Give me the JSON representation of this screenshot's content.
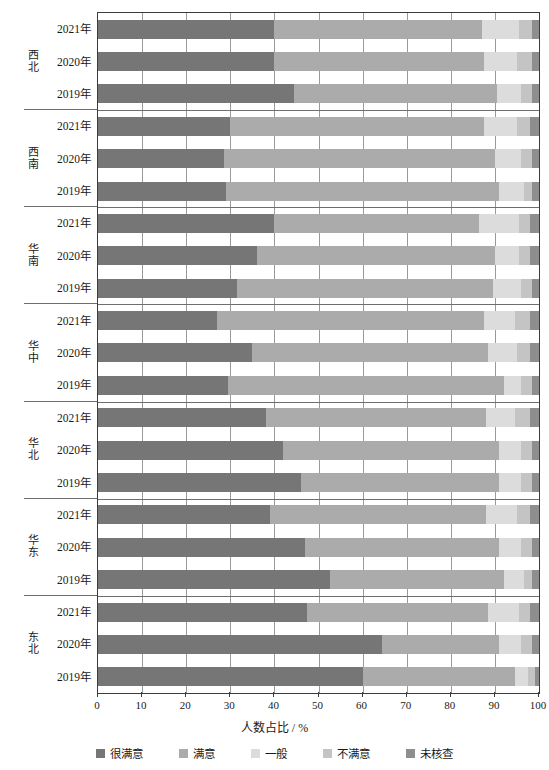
{
  "chart_data": {
    "type": "bar",
    "orientation": "horizontal",
    "stacked": true,
    "normalized_percent": true,
    "title": "",
    "xlabel": "人数占比 / %",
    "ylabel": "",
    "xlim": [
      0,
      100
    ],
    "xticks": [
      0,
      10,
      20,
      30,
      40,
      50,
      60,
      70,
      80,
      90,
      100
    ],
    "grid": "vertical",
    "legend_position": "bottom",
    "legend": [
      "很满意",
      "满意",
      "一般",
      "不满意",
      "未核查"
    ],
    "colors": [
      "#767676",
      "#ababab",
      "#dcdcdc",
      "#c4c4c4",
      "#8e8e8e"
    ],
    "series": [
      {
        "name": "很满意",
        "color": "#767676"
      },
      {
        "name": "满意",
        "color": "#ababab"
      },
      {
        "name": "一般",
        "color": "#dcdcdc"
      },
      {
        "name": "不满意",
        "color": "#c4c4c4"
      },
      {
        "name": "未核查",
        "color": "#8e8e8e"
      }
    ],
    "groups": [
      {
        "region": "西北",
        "rows": [
          {
            "category": "2021年",
            "values": [
              40.0,
              47.0,
              8.5,
              3.0,
              1.5
            ]
          },
          {
            "category": "2020年",
            "values": [
              40.0,
              47.5,
              7.5,
              3.5,
              1.5
            ]
          },
          {
            "category": "2019年",
            "values": [
              44.5,
              46.0,
              5.5,
              2.5,
              1.5
            ]
          }
        ]
      },
      {
        "region": "西南",
        "rows": [
          {
            "category": "2021年",
            "values": [
              30.0,
              57.5,
              7.5,
              3.0,
              2.0
            ]
          },
          {
            "category": "2020年",
            "values": [
              28.5,
              61.5,
              6.0,
              2.5,
              1.5
            ]
          },
          {
            "category": "2019年",
            "values": [
              29.0,
              62.0,
              5.5,
              2.0,
              1.5
            ]
          }
        ]
      },
      {
        "region": "华南",
        "rows": [
          {
            "category": "2021年",
            "values": [
              40.0,
              46.5,
              9.0,
              2.5,
              2.0
            ]
          },
          {
            "category": "2020年",
            "values": [
              36.0,
              54.0,
              5.5,
              2.5,
              2.0
            ]
          },
          {
            "category": "2019年",
            "values": [
              31.5,
              58.0,
              6.5,
              2.5,
              1.5
            ]
          }
        ]
      },
      {
        "region": "华中",
        "rows": [
          {
            "category": "2021年",
            "values": [
              27.0,
              60.5,
              7.0,
              3.5,
              2.0
            ]
          },
          {
            "category": "2020年",
            "values": [
              35.0,
              53.5,
              6.5,
              3.0,
              2.0
            ]
          },
          {
            "category": "2019年",
            "values": [
              29.5,
              62.5,
              4.0,
              2.5,
              1.5
            ]
          }
        ]
      },
      {
        "region": "华北",
        "rows": [
          {
            "category": "2021年",
            "values": [
              38.0,
              50.0,
              6.5,
              3.5,
              2.0
            ]
          },
          {
            "category": "2020年",
            "values": [
              42.0,
              49.0,
              5.0,
              2.5,
              1.5
            ]
          },
          {
            "category": "2019年",
            "values": [
              46.0,
              45.0,
              5.0,
              2.5,
              1.5
            ]
          }
        ]
      },
      {
        "region": "华东",
        "rows": [
          {
            "category": "2021年",
            "values": [
              39.0,
              49.0,
              7.0,
              3.0,
              2.0
            ]
          },
          {
            "category": "2020年",
            "values": [
              47.0,
              44.0,
              5.0,
              2.5,
              1.5
            ]
          },
          {
            "category": "2019年",
            "values": [
              52.5,
              39.5,
              4.5,
              2.0,
              1.5
            ]
          }
        ]
      },
      {
        "region": "东北",
        "rows": [
          {
            "category": "2021年",
            "values": [
              47.5,
              41.0,
              7.0,
              2.5,
              2.0
            ]
          },
          {
            "category": "2020年",
            "values": [
              64.5,
              26.5,
              5.0,
              2.5,
              1.5
            ]
          },
          {
            "category": "2019年",
            "values": [
              60.0,
              34.5,
              3.0,
              1.5,
              1.0
            ]
          }
        ]
      }
    ]
  }
}
